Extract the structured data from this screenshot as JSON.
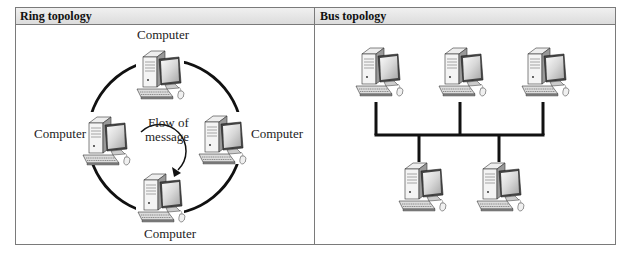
{
  "panels": [
    {
      "title": "Ring topology",
      "nodes": [
        {
          "label": "Computer",
          "position": "top"
        },
        {
          "label": "Computer",
          "position": "left"
        },
        {
          "label": "Computer",
          "position": "right"
        },
        {
          "label": "Computer",
          "position": "bottom"
        }
      ],
      "center_label_line1": "Flow of",
      "center_label_line2": "message"
    },
    {
      "title": "Bus topology",
      "computer_count": 5
    }
  ],
  "colors": {
    "line": "#111111",
    "border": "#7a7a7a",
    "header_bg": "#e4e4e4"
  }
}
